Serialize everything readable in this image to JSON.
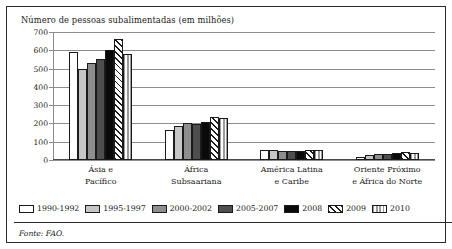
{
  "title": "Número de pessoas subalimentadas (em milhões)",
  "source": "Fonte: FAO.",
  "axis": {
    "yticks": [
      "0",
      "100",
      "200",
      "300",
      "400",
      "500",
      "600",
      "700"
    ]
  },
  "categories": [
    {
      "line1": "Ásia e",
      "line2": "Pacífico"
    },
    {
      "line1": "África",
      "line2": "Subsaariana"
    },
    {
      "line1": "América Latina",
      "line2": "e Caribe"
    },
    {
      "line1": "Oriente Próximo",
      "line2": "e África do Norte"
    }
  ],
  "legend": [
    {
      "label": "1990-1992",
      "fill": "f-white"
    },
    {
      "label": "1995-1997",
      "fill": "f-ltgray"
    },
    {
      "label": "2000-2002",
      "fill": "f-mdgray"
    },
    {
      "label": "2005-2007",
      "fill": "f-dkgray"
    },
    {
      "label": "2008",
      "fill": "f-black"
    },
    {
      "label": "2009",
      "fill": "f-diag"
    },
    {
      "label": "2010",
      "fill": "f-vert"
    }
  ],
  "chart_data": {
    "type": "bar",
    "title": "Número de pessoas subalimentadas (em milhões)",
    "xlabel": "",
    "ylabel": "",
    "ylim": [
      0,
      700
    ],
    "ytick_step": 100,
    "grid": true,
    "legend_position": "bottom",
    "categories": [
      "Ásia e Pacífico",
      "África Subsaariana",
      "América Latina e Caribe",
      "Oriente Próximo e África do Norte"
    ],
    "series": [
      {
        "name": "1990-1992",
        "values": [
          590,
          165,
          54,
          19
        ]
      },
      {
        "name": "1995-1997",
        "values": [
          500,
          185,
          53,
          27
        ]
      },
      {
        "name": "2000-2002",
        "values": [
          530,
          205,
          50,
          32
        ]
      },
      {
        "name": "2005-2007",
        "values": [
          555,
          198,
          47,
          35
        ]
      },
      {
        "name": "2008",
        "values": [
          600,
          210,
          47,
          36
        ]
      },
      {
        "name": "2009",
        "values": [
          660,
          235,
          55,
          42
        ]
      },
      {
        "name": "2010",
        "values": [
          578,
          230,
          53,
          37
        ]
      }
    ]
  }
}
